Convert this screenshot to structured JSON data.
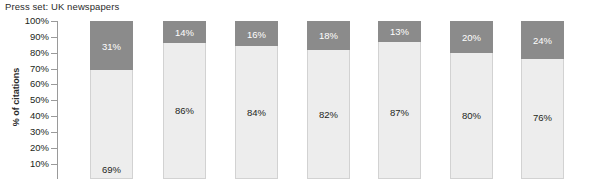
{
  "chart": {
    "title": "Press set: UK newspapers",
    "ylabel": "% of citations"
  },
  "axis": {
    "ticks": [
      "100%",
      "90%",
      "80%",
      "70%",
      "60%",
      "50%",
      "40%",
      "30%",
      "20%",
      "10%"
    ]
  },
  "colors": {
    "top_segment": "#8b8b8b",
    "bottom_segment": "#ededed",
    "axis": "#9a9a9a",
    "text": "#231f20",
    "background": "#ffffff"
  },
  "chart_data": {
    "type": "bar",
    "subtype": "stacked-column",
    "title": "Press set: UK newspapers",
    "xlabel": "",
    "ylabel": "% of citations",
    "ylim": [
      0,
      100
    ],
    "yticks": [
      100,
      90,
      80,
      70,
      60,
      50,
      40,
      30,
      20,
      10
    ],
    "ytick_labels": [
      "100%",
      "90%",
      "80%",
      "70%",
      "60%",
      "50%",
      "40%",
      "30%",
      "20%",
      "10%"
    ],
    "grid": false,
    "legend": "none",
    "categories": [
      "1",
      "2",
      "3",
      "4",
      "5",
      "6",
      "7"
    ],
    "xtick_labels": [],
    "note": "x axis category labels are cropped below the visible image area",
    "series": [
      {
        "name": "lower segment",
        "color": "#ededed",
        "values": [
          69,
          86,
          84,
          82,
          87,
          80,
          76
        ],
        "labels": [
          "69%",
          "86%",
          "84%",
          "82%",
          "87%",
          "80%",
          "76%"
        ]
      },
      {
        "name": "upper segment",
        "color": "#8b8b8b",
        "values": [
          31,
          14,
          16,
          18,
          13,
          20,
          24
        ],
        "labels": [
          "31%",
          "14%",
          "16%",
          "18%",
          "13%",
          "20%",
          "24%"
        ]
      }
    ]
  },
  "bars": [
    {
      "left": 90,
      "top_label": "31%",
      "top_pct": 31,
      "bottom_label": "69%",
      "bottom_pct": 69,
      "bottom_label_offset": 94
    },
    {
      "left": 163,
      "top_label": "14%",
      "top_pct": 14,
      "bottom_label": "86%",
      "bottom_pct": 86,
      "bottom_label_offset": 62
    },
    {
      "left": 235,
      "top_label": "16%",
      "top_pct": 16,
      "bottom_label": "84%",
      "bottom_pct": 84,
      "bottom_label_offset": 61
    },
    {
      "left": 307,
      "top_label": "18%",
      "top_pct": 18,
      "bottom_label": "82%",
      "bottom_pct": 82,
      "bottom_label_offset": 59
    },
    {
      "left": 378,
      "top_label": "13%",
      "top_pct": 13,
      "bottom_label": "87%",
      "bottom_pct": 87,
      "bottom_label_offset": 65
    },
    {
      "left": 450,
      "top_label": "20%",
      "top_pct": 20,
      "bottom_label": "80%",
      "bottom_pct": 80,
      "bottom_label_offset": 57
    },
    {
      "left": 521,
      "top_label": "24%",
      "top_pct": 24,
      "bottom_label": "76%",
      "bottom_pct": 76,
      "bottom_label_offset": 53
    }
  ]
}
